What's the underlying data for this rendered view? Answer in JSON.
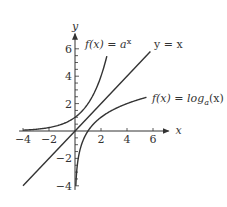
{
  "chart_data": {
    "type": "line",
    "title": "",
    "xlabel": "x",
    "ylabel": "y",
    "xlim": [
      -4.2,
      7
    ],
    "ylim": [
      -4.3,
      7
    ],
    "grid": false,
    "x_ticks": [
      -4,
      -2,
      2,
      4,
      6
    ],
    "y_ticks": [
      -4,
      -2,
      2,
      4,
      6
    ],
    "x_tick_labels": [
      "−4",
      "−2",
      "2",
      "4",
      "6"
    ],
    "y_tick_labels": [
      "−4",
      "−2",
      "2",
      "4",
      "6"
    ],
    "series": [
      {
        "name": "f(x) = a^x",
        "label_text": "f(x) = a",
        "label_sup": "x",
        "base": 2,
        "x": [
          -4,
          -3,
          -2,
          -1,
          0,
          1,
          2,
          2.45
        ],
        "y": [
          0.0625,
          0.125,
          0.25,
          0.5,
          1,
          2,
          4,
          5.46
        ]
      },
      {
        "name": "y = x",
        "label_text": "y = x",
        "x": [
          -4,
          5.8
        ],
        "y": [
          -4,
          5.8
        ]
      },
      {
        "name": "f(x) = log_a(x)",
        "label_text": "f(x) = log",
        "label_sub": "a",
        "label_tail": "(x)",
        "base": 2,
        "x": [
          0.0625,
          0.125,
          0.25,
          0.5,
          1,
          2,
          4,
          5.5
        ],
        "y": [
          -4,
          -3,
          -2,
          -1,
          0,
          1,
          2,
          2.46
        ]
      }
    ],
    "annotations": [
      "f(x) = a^x",
      "y = x",
      "f(x) = log_a(x)"
    ]
  },
  "labels": {
    "x_axis": "x",
    "y_axis": "y",
    "exp": "f(x) = a",
    "exp_sup": "x",
    "identity": "y = x",
    "log_main": "f(x) = log",
    "log_sub": "a",
    "log_tail": "(x)"
  }
}
